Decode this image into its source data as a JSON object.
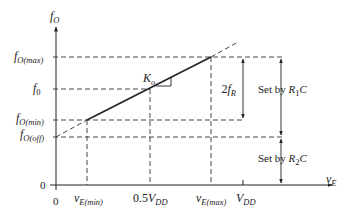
{
  "diagram": {
    "type": "VCO transfer characteristic",
    "y_axis": {
      "symbol": "f",
      "subscript": "O"
    },
    "x_axis": {
      "symbol": "v",
      "subscript": "E"
    },
    "y_labels": {
      "fmax": {
        "symbol": "f",
        "subscript": "O(max)"
      },
      "f0": {
        "symbol": "f",
        "subscript": "0"
      },
      "fmin": {
        "symbol": "f",
        "subscript": "O(min)"
      },
      "foff": {
        "symbol": "f",
        "subscript": "O(off)"
      },
      "zero": "0"
    },
    "x_labels": {
      "zero": "0",
      "vemin": {
        "symbol": "v",
        "subscript": "E(min)"
      },
      "half": {
        "prefix": "0.5",
        "symbol": "V",
        "subscript": "DD"
      },
      "vemax": {
        "symbol": "v",
        "subscript": "E(max)"
      },
      "vdd": {
        "symbol": "V",
        "subscript": "DD"
      }
    },
    "slope_label": {
      "symbol": "K",
      "subscript": "o"
    },
    "range_label": {
      "prefix": "2",
      "symbol": "f",
      "subscript": "R"
    },
    "set_r1": {
      "text": "Set by ",
      "symbol": "R",
      "subscript": "1",
      "suffix": "C"
    },
    "set_r2": {
      "text": "Set by ",
      "symbol": "R",
      "subscript": "2",
      "suffix": "C"
    }
  }
}
